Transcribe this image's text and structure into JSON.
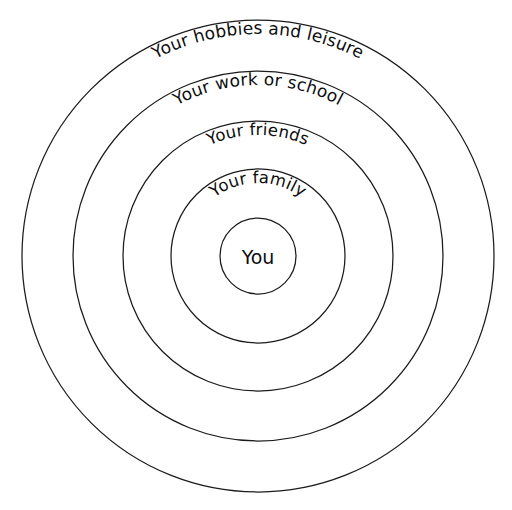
{
  "diagram": {
    "background_color": "#ffffff",
    "stroke_color": "#1b1b1b",
    "text_color": "#0d0d0d",
    "center": {
      "x": 258,
      "y": 256
    },
    "center_node": {
      "label": "You",
      "radius": 38
    },
    "rings": [
      {
        "label": "Your family",
        "radius": 87,
        "level": 1,
        "label_radius": 73
      },
      {
        "label": "Your friends",
        "radius": 135,
        "level": 2,
        "label_radius": 121
      },
      {
        "label": "Your work or school",
        "radius": 185,
        "level": 3,
        "label_radius": 171
      },
      {
        "label": "Your hobbies and leisure",
        "radius": 236,
        "level": 4,
        "label_radius": 222
      }
    ]
  }
}
